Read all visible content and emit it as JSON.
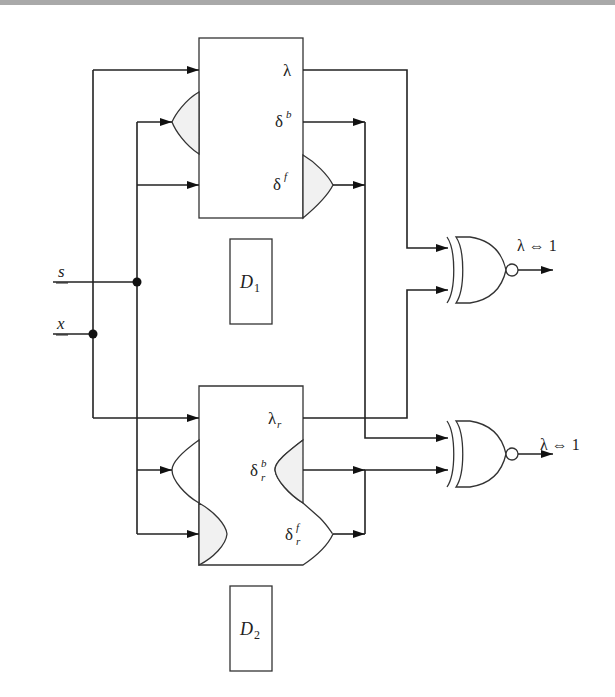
{
  "diagram": {
    "type": "logic-circuit",
    "inputs": [
      {
        "id": "s",
        "label": "s",
        "underlined": true
      },
      {
        "id": "x",
        "label": "x",
        "underlined": true
      }
    ],
    "blocks": [
      {
        "id": "top-block",
        "outputs": {
          "lambda": "λ",
          "delta_b": "δ",
          "delta_b_sup": "b",
          "delta_f": "δ",
          "delta_f_sup": "f"
        }
      },
      {
        "id": "bottom-block",
        "outputs": {
          "lambda": "λ",
          "lambda_sub": "r",
          "delta_b": "δ",
          "delta_b_sup": "b",
          "delta_b_sub": "r",
          "delta_f": "δ",
          "delta_f_sup": "f",
          "delta_f_sub": "r"
        }
      }
    ],
    "domains": [
      {
        "id": "D1",
        "label": "D",
        "sub": "1"
      },
      {
        "id": "D2",
        "label": "D",
        "sub": "2"
      }
    ],
    "gates": [
      {
        "id": "xnor-top",
        "type": "XNOR",
        "output_label": "λ ⇔ 1"
      },
      {
        "id": "xnor-bottom",
        "type": "XNOR",
        "output_label": "λ ⇔ 1"
      }
    ],
    "colors": {
      "line": "#222222",
      "shade": "#f1f1f1",
      "header_bar": "#a9a9a9"
    }
  }
}
